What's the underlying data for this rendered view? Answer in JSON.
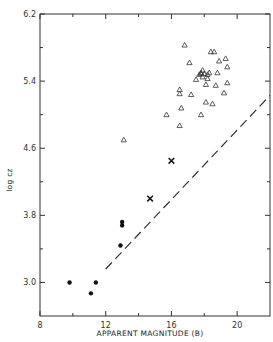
{
  "chart_data": {
    "type": "scatter",
    "title": "",
    "xlabel": "APPARENT MAGNITUDE (B)",
    "ylabel": "log cz",
    "xlim": [
      8,
      22
    ],
    "ylim": [
      2.6,
      6.2
    ],
    "x_ticks": [
      8,
      12,
      16,
      20
    ],
    "y_ticks": [
      3.0,
      3.8,
      4.6,
      5.4,
      6.2
    ],
    "x_tick_labels": [
      "8",
      "12",
      "16",
      "20"
    ],
    "y_tick_labels": [
      "3.0",
      "3.8",
      "4.6",
      "5.4",
      "6.2"
    ],
    "grid": false,
    "legend": null,
    "series": [
      {
        "name": "filled circles",
        "marker": "circle-filled",
        "points": [
          [
            9.8,
            3.0
          ],
          [
            11.1,
            2.87
          ],
          [
            11.4,
            3.0
          ],
          [
            12.9,
            3.44
          ],
          [
            13.0,
            3.68
          ],
          [
            13.0,
            3.72
          ]
        ]
      },
      {
        "name": "crosses",
        "marker": "x",
        "points": [
          [
            14.7,
            4.0
          ],
          [
            16.0,
            4.45
          ]
        ]
      },
      {
        "name": "open triangles",
        "marker": "triangle-open",
        "points": [
          [
            13.1,
            4.7
          ],
          [
            15.7,
            5.0
          ],
          [
            16.5,
            4.87
          ],
          [
            16.6,
            5.08
          ],
          [
            16.5,
            5.25
          ],
          [
            16.5,
            5.3
          ],
          [
            16.8,
            5.83
          ],
          [
            17.1,
            5.62
          ],
          [
            17.2,
            5.24
          ],
          [
            17.5,
            5.42
          ],
          [
            17.7,
            5.48
          ],
          [
            17.8,
            5.49
          ],
          [
            17.8,
            5.5
          ],
          [
            17.9,
            5.53
          ],
          [
            17.9,
            5.45
          ],
          [
            18.0,
            5.49
          ],
          [
            18.1,
            5.36
          ],
          [
            18.1,
            5.15
          ],
          [
            18.2,
            5.48
          ],
          [
            18.2,
            5.43
          ],
          [
            18.3,
            5.5
          ],
          [
            17.8,
            5.0
          ],
          [
            18.4,
            5.75
          ],
          [
            18.5,
            5.13
          ],
          [
            18.6,
            5.75
          ],
          [
            18.7,
            5.35
          ],
          [
            18.8,
            5.5
          ],
          [
            18.9,
            5.64
          ],
          [
            19.2,
            5.26
          ],
          [
            19.3,
            5.67
          ],
          [
            19.4,
            5.57
          ],
          [
            19.4,
            5.38
          ]
        ]
      },
      {
        "name": "dashed limit line",
        "marker": "dashed-line",
        "points": [
          [
            12.0,
            3.16
          ],
          [
            22.0,
            5.23
          ]
        ]
      }
    ]
  },
  "labels": {
    "xlabel": "APPARENT MAGNITUDE (B)",
    "ylabel": "log cz"
  }
}
